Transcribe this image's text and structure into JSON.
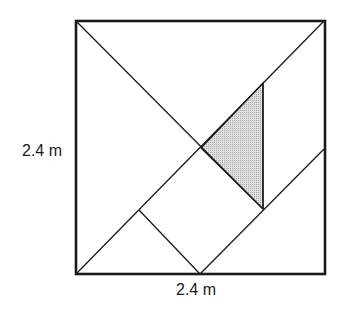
{
  "diagram": {
    "type": "tangram-square",
    "labels": {
      "left_side": "2.4 m",
      "bottom_side": "2.4 m"
    },
    "colors": {
      "stroke": "#1a1a1a",
      "shaded_fill": "#d0d0d0",
      "background": "#ffffff"
    },
    "shaded_piece": "small triangle"
  }
}
